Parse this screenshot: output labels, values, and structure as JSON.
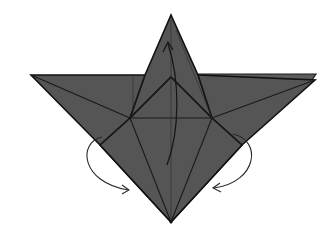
{
  "diagram": {
    "type": "origami-fold-diagram",
    "background": "#ffffff",
    "paper_color": "#555555",
    "line_color": "#111111",
    "shape": "star-like folded base with top spike, two side wings and bottom point",
    "points": {
      "top_tip": [
        171,
        15
      ],
      "left_wing_tip": [
        31,
        75
      ],
      "right_wing_tip": [
        315,
        75
      ],
      "bottom_tip": [
        171,
        222
      ],
      "inner_apex": [
        171,
        77
      ],
      "left_mid": [
        130,
        118
      ],
      "right_mid": [
        212,
        118
      ],
      "left_flap_corner": [
        100,
        145
      ],
      "right_flap_corner": [
        242,
        145
      ]
    },
    "arrows": [
      {
        "name": "fold-up-arrow",
        "direction": "up",
        "description": "Valley-fold lower flap upward to top tip"
      },
      {
        "name": "left-swivel-arrow",
        "direction": "inward",
        "description": "Fold left side behind / inward toward center"
      },
      {
        "name": "right-swivel-arrow",
        "direction": "inward",
        "description": "Fold right side behind / inward toward center"
      }
    ]
  }
}
